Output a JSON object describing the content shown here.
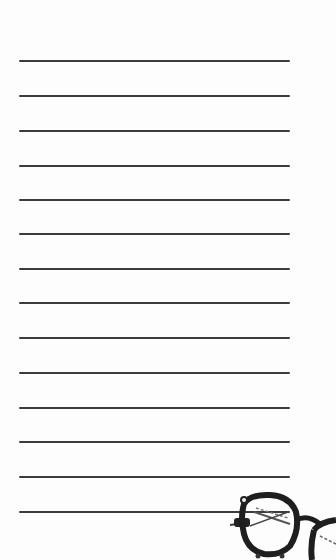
{
  "notepad": {
    "line_count": 14,
    "line_color": "#3c3c3c",
    "background_color": "#fdfdfd",
    "lines_y": [
      61,
      96,
      131,
      166,
      200,
      234,
      269,
      303,
      338,
      373,
      408,
      442,
      477,
      512
    ]
  },
  "decoration": {
    "icon": "eyeglasses-icon"
  }
}
